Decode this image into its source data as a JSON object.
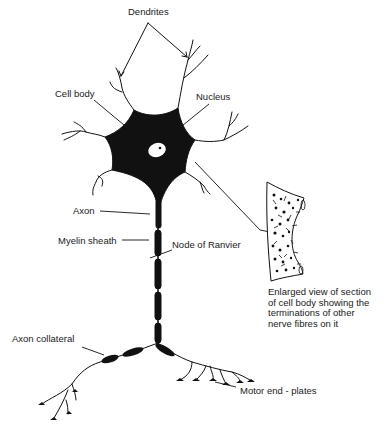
{
  "diagram": {
    "labels": {
      "dendrites": "Dendrites",
      "cell_body": "Cell body",
      "nucleus": "Nucleus",
      "axon": "Axon",
      "myelin_sheath": "Myelin sheath",
      "node_of_ranvier": "Node of Ranvier",
      "axon_collateral": "Axon collateral",
      "motor_end_plates": "Motor end - plates"
    },
    "inset_caption": "Enlarged view of section\nof cell body showing the\nterminations of other\nnerve fibres on it",
    "colors": {
      "ink": "#111111",
      "background": "#ffffff"
    }
  }
}
